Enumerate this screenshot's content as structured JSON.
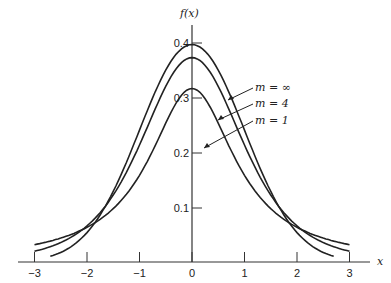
{
  "chart_data": {
    "type": "line",
    "title": "",
    "xlabel": "x",
    "ylabel": "f(x)",
    "xlim": [
      -3.3,
      3.3
    ],
    "ylim": [
      0,
      0.42
    ],
    "x_ticks": [
      "-3",
      "-2",
      "-1",
      "0",
      "1",
      "2",
      "3"
    ],
    "y_ticks": [
      "0.1",
      "0.2",
      "0.3",
      "0.4"
    ],
    "grid": false,
    "series": [
      {
        "name": "m = ∞",
        "x": [
          -3,
          -2.5,
          -2,
          -1.5,
          -1,
          -0.5,
          0,
          0.5,
          1,
          1.5,
          2,
          2.5,
          3
        ],
        "values": [
          0.004,
          0.018,
          0.054,
          0.13,
          0.242,
          0.352,
          0.399,
          0.352,
          0.242,
          0.13,
          0.054,
          0.018,
          0.004
        ]
      },
      {
        "name": "m = 4",
        "x": [
          -3,
          -2.5,
          -2,
          -1.5,
          -1,
          -0.5,
          0,
          0.5,
          1,
          1.5,
          2,
          2.5,
          3
        ],
        "values": [
          0.02,
          0.036,
          0.066,
          0.124,
          0.215,
          0.322,
          0.375,
          0.322,
          0.215,
          0.124,
          0.066,
          0.036,
          0.02
        ]
      },
      {
        "name": "m = 1",
        "x": [
          -3,
          -2.5,
          -2,
          -1.5,
          -1,
          -0.5,
          0,
          0.5,
          1,
          1.5,
          2,
          2.5,
          3
        ],
        "values": [
          0.032,
          0.044,
          0.064,
          0.098,
          0.159,
          0.255,
          0.318,
          0.255,
          0.159,
          0.098,
          0.064,
          0.044,
          0.032
        ]
      }
    ],
    "annotations": [
      "m = ∞",
      "m = 4",
      "m = 1"
    ]
  },
  "labels": {
    "y_axis": "f(x)",
    "x_axis": "x",
    "m_inf": "m = ∞",
    "m_4": "m = 4",
    "m_1": "m = 1"
  },
  "ticks": {
    "x": [
      "−3",
      "−2",
      "−1",
      "0",
      "1",
      "2",
      "3"
    ],
    "y": [
      "0.1",
      "0.2",
      "0.3",
      "0.4"
    ]
  }
}
